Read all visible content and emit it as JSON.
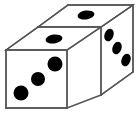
{
  "image": {
    "title": "Two dice shown in isometric view",
    "width": 140,
    "height": 118,
    "background_color": "#ffffff",
    "edge_color": "#555555",
    "face_color": "#ffffff",
    "pip_color": "#000000",
    "object_count": 2
  },
  "dice": [
    {
      "name": "front-die",
      "position": "left-front",
      "faces": [
        {
          "name": "front-left-face",
          "orientation": "front",
          "pip_count": 3,
          "polygon": "6,50 67,50 67,108 6,108",
          "pips": [
            {
              "cx": 55,
              "cy": 64,
              "rx": 7.5,
              "ry": 7.5
            },
            {
              "cx": 38,
              "cy": 79,
              "rx": 7,
              "ry": 7
            },
            {
              "cx": 21,
              "cy": 93,
              "rx": 7.5,
              "ry": 7.5
            }
          ]
        },
        {
          "name": "top-face",
          "orientation": "top",
          "pip_count": 1,
          "polygon": "6,50 38,27 101,27 67,50",
          "pips": [
            {
              "cx": 54,
              "cy": 39,
              "rx": 8.5,
              "ry": 4.5,
              "rotate": -8
            }
          ]
        }
      ]
    },
    {
      "name": "rear-die",
      "position": "right-rear",
      "faces": [
        {
          "name": "rear-top-face",
          "orientation": "top",
          "pip_count": 1,
          "polygon": "38,27 68,5 133,5 101,27",
          "pips": [
            {
              "cx": 86,
              "cy": 15,
              "rx": 8.5,
              "ry": 4.5,
              "rotate": -8
            }
          ]
        },
        {
          "name": "right-side-face",
          "orientation": "right",
          "pip_count": 3,
          "polygon": "101,27 133,5 133,72 101,95",
          "pips": [
            {
              "cx": 109,
              "cy": 35,
              "rx": 4.5,
              "ry": 6.5,
              "rotate": 20
            },
            {
              "cx": 117,
              "cy": 48,
              "rx": 4.5,
              "ry": 6.5,
              "rotate": 20
            },
            {
              "cx": 126,
              "cy": 60,
              "rx": 4.5,
              "ry": 6.5,
              "rotate": 20
            }
          ]
        }
      ]
    }
  ],
  "edges": [
    {
      "name": "front-face-left-edge",
      "d": "M6,50 L6,108"
    },
    {
      "name": "front-face-bottom-edge",
      "d": "M6,108 L67,108"
    },
    {
      "name": "front-face-right-edge",
      "d": "M67,50 L67,108"
    },
    {
      "name": "front-face-top-edge",
      "d": "M6,50 L67,50"
    },
    {
      "name": "top-face-left-edge",
      "d": "M6,50 L38,27"
    },
    {
      "name": "top-face-far-edge",
      "d": "M38,27 L101,27"
    },
    {
      "name": "top-face-right-edge",
      "d": "M67,50 L101,27"
    },
    {
      "name": "rear-top-left-edge",
      "d": "M38,27 L68,5"
    },
    {
      "name": "rear-top-far-edge",
      "d": "M68,5 L133,5"
    },
    {
      "name": "rear-top-right-edge",
      "d": "M101,27 L133,5"
    },
    {
      "name": "rear-right-vertical-edge",
      "d": "M133,5 L133,72"
    },
    {
      "name": "rear-right-bottom-edge",
      "d": "M133,72 L101,95"
    },
    {
      "name": "die-separator-vertical-edge",
      "d": "M101,27 L101,95"
    },
    {
      "name": "front-die-bottom-right-edge",
      "d": "M67,108 L101,95"
    }
  ]
}
